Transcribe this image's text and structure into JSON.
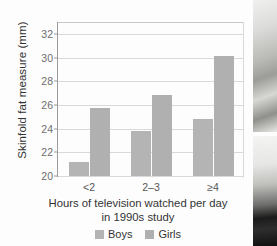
{
  "chart_data": {
    "type": "bar",
    "title": "",
    "xlabel": "Hours of television watched per day in 1990s study",
    "xlabel_line1": "Hours of television watched per day",
    "xlabel_line2": "in 1990s study",
    "ylabel": "Skinfold fat measure (mm)",
    "categories": [
      "<2",
      "2–3",
      "≥4"
    ],
    "series": [
      {
        "name": "Boys",
        "values": [
          21.2,
          23.8,
          24.8
        ],
        "color": "#b4b4b4"
      },
      {
        "name": "Girls",
        "values": [
          25.7,
          26.8,
          30.1
        ],
        "color": "#b0b0b0"
      }
    ],
    "ylim": [
      20,
      33
    ],
    "yticks": [
      20,
      22,
      24,
      26,
      28,
      30,
      32
    ],
    "ytick_labels": [
      "20",
      "22",
      "24",
      "26",
      "28",
      "30",
      "32"
    ],
    "grid": true,
    "grid_axis": "y",
    "legend_position": "bottom"
  },
  "legend": {
    "items": [
      {
        "label": "Boys"
      },
      {
        "label": "Girls"
      }
    ]
  },
  "decoration": {
    "photo_top_alt": "photograph",
    "photo_bottom_alt": "photograph"
  }
}
